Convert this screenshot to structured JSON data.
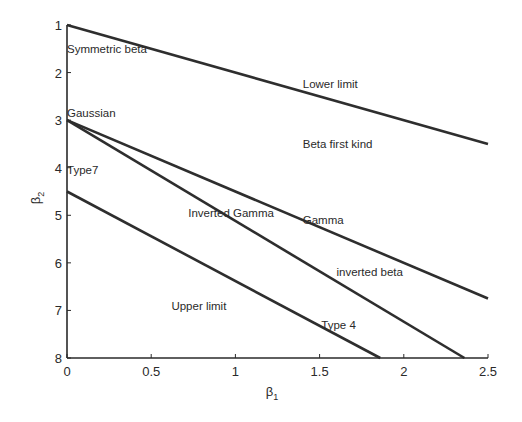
{
  "chart_data": {
    "type": "line",
    "title": "",
    "xlabel": "β1",
    "ylabel": "β2",
    "xlim": [
      0,
      2.5
    ],
    "ylim": [
      8,
      1
    ],
    "y_inverted": true,
    "grid": false,
    "x_ticks": [
      0,
      0.5,
      1,
      1.5,
      2,
      2.5
    ],
    "x_tick_labels": [
      "0",
      "0.5",
      "1",
      "1.5",
      "2",
      "2.5"
    ],
    "y_ticks": [
      1,
      2,
      3,
      4,
      5,
      6,
      7,
      8
    ],
    "y_tick_labels": [
      "1",
      "2",
      "3",
      "4",
      "5",
      "6",
      "7",
      "8"
    ],
    "series": [
      {
        "name": "Lower limit",
        "x": [
          0,
          2.5
        ],
        "y": [
          1,
          3.5
        ]
      },
      {
        "name": "Gamma",
        "x": [
          0,
          2.5
        ],
        "y": [
          3,
          6.75
        ]
      },
      {
        "name": "Type 4 / inverted beta boundary",
        "x": [
          0,
          2.36
        ],
        "y": [
          3,
          8
        ]
      },
      {
        "name": "Upper limit",
        "x": [
          0,
          1.86
        ],
        "y": [
          4.5,
          8
        ]
      }
    ],
    "annotations": [
      {
        "text": "Symmetric beta",
        "x": 0.0,
        "y": 1.5
      },
      {
        "text": "Lower limit",
        "x": 1.4,
        "y": 2.25
      },
      {
        "text": "Gaussian",
        "x": 0.0,
        "y": 2.85
      },
      {
        "text": "Beta first kind",
        "x": 1.4,
        "y": 3.5
      },
      {
        "text": "Type7",
        "x": 0.0,
        "y": 4.05
      },
      {
        "text": "Inverted Gamma",
        "x": 0.72,
        "y": 4.95
      },
      {
        "text": "Gamma",
        "x": 1.4,
        "y": 5.1
      },
      {
        "text": "inverted beta",
        "x": 1.6,
        "y": 6.2
      },
      {
        "text": "Upper limit",
        "x": 0.62,
        "y": 6.9
      },
      {
        "text": "Type 4",
        "x": 1.51,
        "y": 7.3
      }
    ]
  }
}
